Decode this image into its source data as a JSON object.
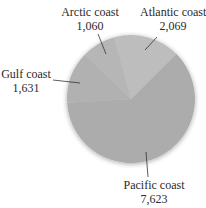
{
  "chart_data": {
    "type": "pie",
    "title": "",
    "categories": [
      "Pacific coast",
      "Gulf coast",
      "Arctic coast",
      "Atlantic coast"
    ],
    "values": [
      7623,
      1631,
      1060,
      2069
    ],
    "value_labels": [
      "7,623",
      "1,631",
      "1,060",
      "2,069"
    ],
    "colors": [
      "#acacac",
      "#b1b1b1",
      "#b6b6b6",
      "#bdbdbd"
    ],
    "start_angle_deg": 45,
    "direction": "clockwise",
    "legend": "none",
    "labels_outside_with_leader_lines": true
  },
  "labels": {
    "arctic": {
      "name": "Arctic coast",
      "value": "1,060"
    },
    "atlantic": {
      "name": "Atlantic coast",
      "value": "2,069"
    },
    "gulf": {
      "name": "Gulf coast",
      "value": "1,631"
    },
    "pacific": {
      "name": "Pacific coast",
      "value": "7,623"
    }
  }
}
